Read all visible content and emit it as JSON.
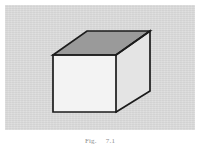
{
  "figure": {
    "panel": {
      "background_color": "#d9d9d9",
      "page_background_color": "#ffffff",
      "x": 5,
      "y": 5,
      "width": 190,
      "height": 125
    },
    "caption": {
      "number": "Fig.",
      "text": "7.1",
      "full": "Fig.   7.1",
      "color": "#8e8e8e",
      "clipped": "true"
    },
    "drawing": {
      "type": "3d-line-drawing",
      "subject": "rectangular-box",
      "stroke_color": "#1a1a1a",
      "stroke_width": 1.6,
      "faces": [
        {
          "name": "top-face",
          "fill_color": "#9a9a9a",
          "points": "53,55 87,31 150,31 116,55"
        },
        {
          "name": "front-face",
          "fill_color": "#f2f2f2",
          "points": "53,55 116,55 116,112 53,112"
        },
        {
          "name": "right-face",
          "fill_color": "#e4e4e4",
          "points": "116,55 150,31 150,91 116,112"
        }
      ],
      "vertices": {
        "front_top_left": [
          53,
          55
        ],
        "front_top_right": [
          116,
          55
        ],
        "back_top_left": [
          87,
          31
        ],
        "back_top_right": [
          150,
          31
        ],
        "front_bottom_left": [
          53,
          112
        ],
        "front_bottom_right": [
          116,
          112
        ],
        "back_bottom_right": [
          150,
          91
        ]
      }
    }
  }
}
